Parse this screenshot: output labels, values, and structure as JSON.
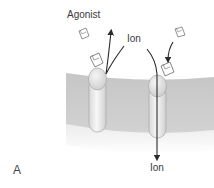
{
  "figure": {
    "panel_label": "A",
    "labels": {
      "agonist": "Agonist",
      "ion_top": "Ion",
      "ion_bottom": "Ion"
    },
    "elements": [
      {
        "name": "cell-membrane",
        "description": "lipid bilayer band"
      },
      {
        "name": "ion-channel-left",
        "description": "receptor channel with agonist bound, ion exiting upward"
      },
      {
        "name": "ion-channel-right",
        "description": "receptor channel with agonist binding, ion entering downward"
      }
    ],
    "colors": {
      "membrane": "#c9c9c9",
      "channel": "#ececec",
      "arrow": "#2a2a2a",
      "text": "#3a3a3a"
    }
  }
}
